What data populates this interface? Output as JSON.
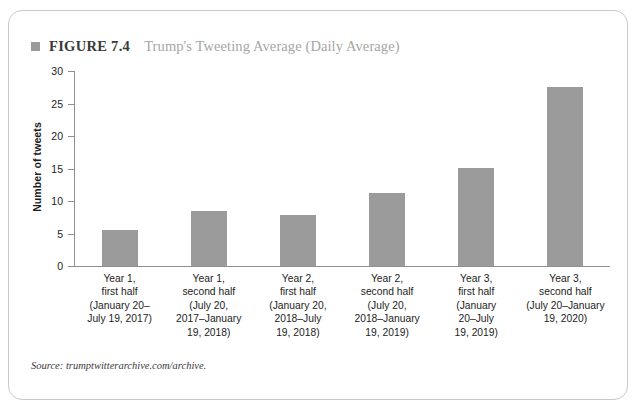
{
  "figure": {
    "bullet_icon": "square-bullet-icon",
    "number_label": "FIGURE 7.4",
    "title": "Trump's Tweeting Average (Daily Average)",
    "source": "Source: trumptwitterarchive.com/archive.",
    "accent_color": "#9b9b9b",
    "title_color": "#a6a6a6",
    "border_color": "#c9c9c9"
  },
  "chart_data": {
    "type": "bar",
    "title": "Trump's Tweeting Average (Daily Average)",
    "xlabel": "",
    "ylabel": "Number of tweets",
    "ylim": [
      0,
      30
    ],
    "yticks": [
      0,
      5,
      10,
      15,
      20,
      25,
      30
    ],
    "ytick_labels": [
      "0",
      "5",
      "10",
      "15",
      "20",
      "25",
      "30"
    ],
    "grid": false,
    "legend": "none",
    "bar_color": "#9b9b9b",
    "categories": [
      "Year 1,\nfirst half\n(January 20–\nJuly 19, 2017)",
      "Year 1,\nsecond half\n(July 20,\n2017–January\n19, 2018)",
      "Year 2,\nfirst half\n(January 20,\n2018–July\n19, 2018)",
      "Year 2,\nsecond half\n(July 20,\n2018–January\n19, 2019)",
      "Year 3,\nfirst half\n(January\n20–July\n19, 2019)",
      "Year 3,\nsecond half\n(July 20–January\n19, 2020)"
    ],
    "values": [
      5.6,
      8.4,
      7.8,
      11.3,
      15.1,
      27.5
    ]
  }
}
